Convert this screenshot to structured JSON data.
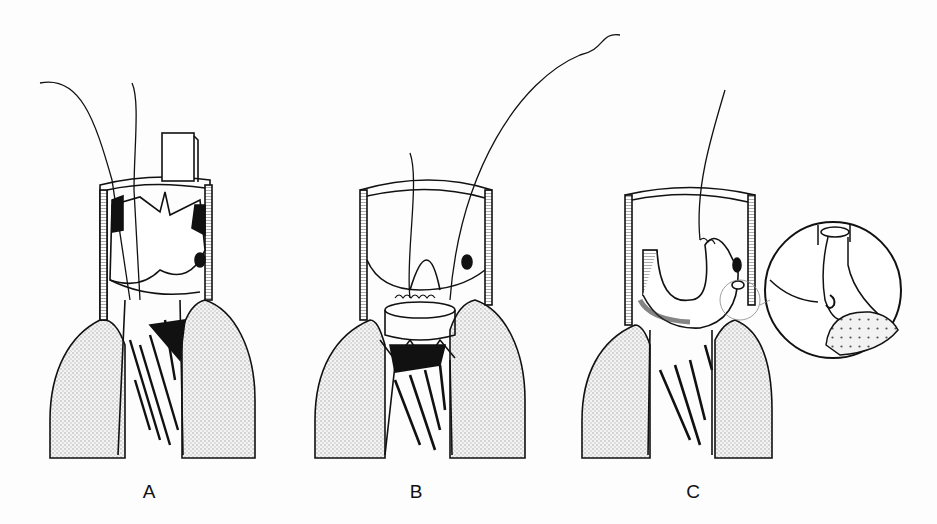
{
  "figure": {
    "panels": [
      {
        "id": "A",
        "label": "A",
        "label_pos": [
          149,
          481
        ]
      },
      {
        "id": "B",
        "label": "B",
        "label_pos": [
          416,
          481
        ]
      },
      {
        "id": "C",
        "label": "C",
        "label_pos": [
          693,
          481
        ]
      }
    ],
    "inset": {
      "panel": "C",
      "center": [
        833,
        290
      ],
      "radius": 68
    },
    "colors": {
      "ink": "#111111",
      "background": "#fdfdfd",
      "stipple": "#bdbdbd"
    }
  }
}
